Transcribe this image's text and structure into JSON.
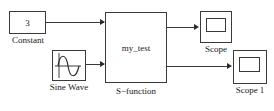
{
  "diagram": {
    "background_color": "#ffffff",
    "line_color": "#3a3a3a",
    "text_color": "#1a1a1a"
  },
  "blocks": {
    "constant": {
      "value": "3",
      "label": "Constant",
      "icon": "constant-block"
    },
    "sine_wave": {
      "value": "",
      "label": "Sine Wave",
      "icon": "sine-wave-icon"
    },
    "sfunction": {
      "value": "my_test",
      "label": "S−function",
      "icon": "sfunction-block"
    },
    "scope": {
      "label": "Scope",
      "icon": "scope-icon"
    },
    "scope1": {
      "label": "Scope 1",
      "icon": "scope-icon"
    }
  },
  "connections": [
    {
      "name": "constant-to-sfunction",
      "from": "constant",
      "to": "sfunction"
    },
    {
      "name": "sine-to-sfunction",
      "from": "sine_wave",
      "to": "sfunction"
    },
    {
      "name": "sfunction-to-scope",
      "from": "sfunction",
      "to": "scope"
    },
    {
      "name": "sfunction-to-scope1",
      "from": "sfunction",
      "to": "scope1"
    }
  ]
}
